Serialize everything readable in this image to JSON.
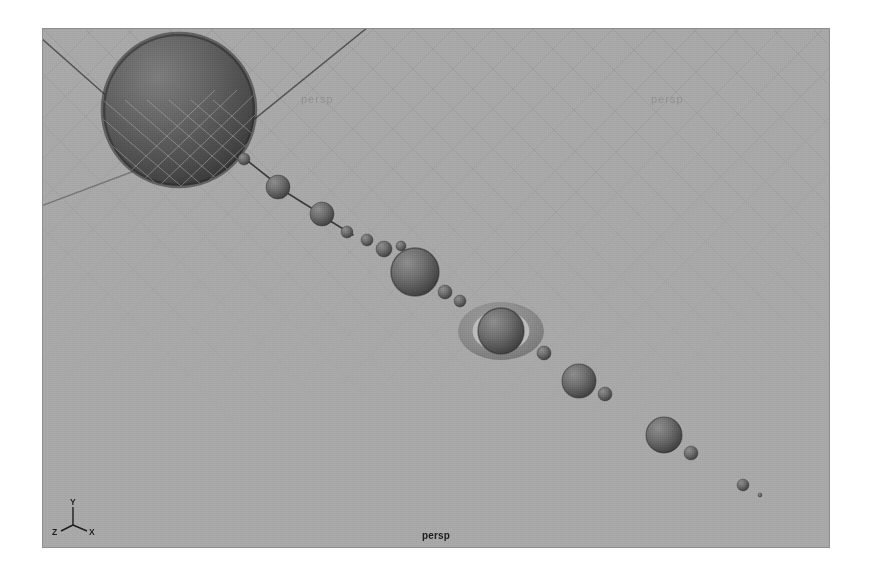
{
  "viewport": {
    "camera_label": "persp",
    "background_color": "#a8a8a8",
    "border_color": "#8e8e8e",
    "page_background": "#ffffff",
    "bounds": {
      "x": 42,
      "y": 28,
      "width": 788,
      "height": 520
    }
  },
  "axis_gizmo": {
    "name": "axis-indicator",
    "axes": [
      {
        "label": "Y",
        "direction": "up"
      },
      {
        "label": "X",
        "direction": "lower-right"
      },
      {
        "label": "Z",
        "direction": "lower-left"
      }
    ],
    "color": "#1d1d1d"
  },
  "ghost_labels": [
    {
      "text": "persp",
      "x": 300,
      "y": 92
    },
    {
      "text": "persp",
      "x": 650,
      "y": 92
    }
  ],
  "grid": {
    "visible": true,
    "line_color": "#9a9a9a",
    "axis_line_color": "#454545",
    "spacing_px": 26,
    "description": "perspective ground plane crosshatch"
  },
  "chart_data": {
    "type": "scatter",
    "xlabel": "",
    "ylabel": "",
    "note": "Spheres arranged along a diagonal orbit chain from the sun at upper-left to the outermost planet at lower-right",
    "sun": {
      "name": "sun",
      "cx": 178,
      "cy": 109,
      "r": 76,
      "fill": "#6e6e6e",
      "shade": "#3f3f3f"
    },
    "connector_color": "#3a3a3a",
    "connectors": [
      {
        "x1": 243,
        "y1": 157,
        "x2": 277,
        "y2": 184
      },
      {
        "x1": 283,
        "y1": 190,
        "x2": 320,
        "y2": 213
      },
      {
        "x1": 326,
        "y1": 218,
        "x2": 352,
        "y2": 234
      }
    ],
    "bodies": [
      {
        "name": "mercury",
        "cx": 243,
        "cy": 158,
        "r": 6,
        "fill": "#6f6f6f"
      },
      {
        "name": "venus",
        "cx": 277,
        "cy": 186,
        "r": 12,
        "fill": "#6d6d6d"
      },
      {
        "name": "earth",
        "cx": 321,
        "cy": 213,
        "r": 12,
        "fill": "#6d6d6d"
      },
      {
        "name": "moon-earth",
        "cx": 346,
        "cy": 231,
        "r": 6,
        "fill": "#6f6f6f"
      },
      {
        "name": "mars",
        "cx": 366,
        "cy": 239,
        "r": 6,
        "fill": "#6f6f6f"
      },
      {
        "name": "mars-moon",
        "cx": 383,
        "cy": 248,
        "r": 8,
        "fill": "#6d6d6d"
      },
      {
        "name": "asteroid-1",
        "cx": 400,
        "cy": 245,
        "r": 5,
        "fill": "#6f6f6f"
      },
      {
        "name": "asteroid-2",
        "cx": 413,
        "cy": 254,
        "r": 5,
        "fill": "#6f6f6f"
      },
      {
        "name": "jupiter",
        "cx": 414,
        "cy": 271,
        "r": 24,
        "fill": "#6b6b6b"
      },
      {
        "name": "jupiter-moon",
        "cx": 444,
        "cy": 291,
        "r": 7,
        "fill": "#6f6f6f"
      },
      {
        "name": "saturn-moon-a",
        "cx": 459,
        "cy": 300,
        "r": 6,
        "fill": "#6f6f6f"
      },
      {
        "name": "saturn",
        "cx": 500,
        "cy": 330,
        "r": 23,
        "fill": "#6b6b6b"
      },
      {
        "name": "saturn-moon-b",
        "cx": 543,
        "cy": 352,
        "r": 7,
        "fill": "#6f6f6f"
      },
      {
        "name": "uranus",
        "cx": 578,
        "cy": 380,
        "r": 17,
        "fill": "#6b6b6b"
      },
      {
        "name": "uranus-moon",
        "cx": 604,
        "cy": 393,
        "r": 7,
        "fill": "#6f6f6f"
      },
      {
        "name": "neptune",
        "cx": 663,
        "cy": 434,
        "r": 18,
        "fill": "#6b6b6b"
      },
      {
        "name": "neptune-moon",
        "cx": 690,
        "cy": 452,
        "r": 7,
        "fill": "#6f6f6f"
      },
      {
        "name": "pluto",
        "cx": 742,
        "cy": 484,
        "r": 6,
        "fill": "#6f6f6f"
      },
      {
        "name": "pluto-moon",
        "cx": 759,
        "cy": 494,
        "r": 2,
        "fill": "#6f6f6f"
      }
    ],
    "ring": {
      "name": "saturn-ring",
      "cx": 500,
      "cy": 330,
      "rx": 43,
      "ry": 29,
      "fill": "#848484",
      "gap_color": "#bcbcbc"
    }
  }
}
